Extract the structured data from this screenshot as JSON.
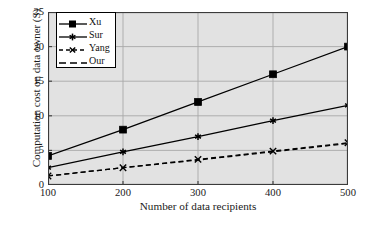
{
  "chart_data": {
    "type": "line",
    "title": "",
    "xlabel": "Number of data recipients",
    "ylabel": "Computation cost on data owner (S)",
    "x": [
      100,
      200,
      300,
      400,
      500
    ],
    "xlim": [
      100,
      500
    ],
    "ylim": [
      0,
      25
    ],
    "xticks": [
      "100",
      "200",
      "300",
      "400",
      "500"
    ],
    "yticks": [
      "0",
      "5",
      "10",
      "15",
      "20",
      "25"
    ],
    "grid": true,
    "legend_position": "upper-left",
    "series": [
      {
        "name": "Xu",
        "values": [
          4.2,
          8.0,
          12.0,
          16.0,
          20.0
        ],
        "line_style": "solid",
        "marker": "square-filled",
        "color": "#000000"
      },
      {
        "name": "Sur",
        "values": [
          2.5,
          4.8,
          7.0,
          9.3,
          11.5
        ],
        "line_style": "solid",
        "marker": "asterisk",
        "color": "#000000"
      },
      {
        "name": "Yang",
        "values": [
          1.3,
          2.5,
          3.7,
          4.9,
          6.1
        ],
        "line_style": "dashed",
        "marker": "cross",
        "color": "#000000"
      },
      {
        "name": "Our",
        "values": [
          1.3,
          2.5,
          3.6,
          4.8,
          6.0
        ],
        "line_style": "dashed",
        "marker": "none",
        "color": "#000000"
      }
    ]
  },
  "axes": {
    "y_tick_labels": [
      "25",
      "20",
      "15",
      "10",
      "5",
      "0"
    ],
    "x_tick_labels": [
      "100",
      "200",
      "300",
      "400",
      "500"
    ],
    "y_title": "Computation cost on data owner (S)",
    "x_title": "Number of data recipients"
  },
  "legend": {
    "entries": [
      {
        "label": "Xu"
      },
      {
        "label": "Sur"
      },
      {
        "label": "Yang"
      },
      {
        "label": "Our"
      }
    ]
  },
  "colors": {
    "plot_background": "#e2e2e2",
    "grid": "#a8a8a8",
    "axis": "#3b3b3b",
    "series": "#000000",
    "legend_background": "#ffffff",
    "page_background": "#ffffff"
  }
}
